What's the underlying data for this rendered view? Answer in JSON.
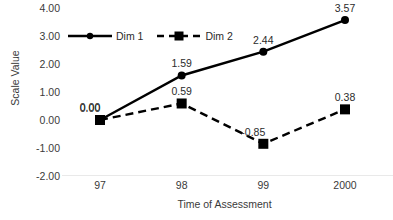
{
  "chart_data": {
    "type": "line",
    "title": "",
    "xlabel": "Time of Assessment",
    "ylabel": "Scale Value",
    "categories": [
      "97",
      "98",
      "99",
      "2000"
    ],
    "ylim": [
      -2.0,
      4.0
    ],
    "yticks": [
      "4.00",
      "3.00",
      "2.00",
      "1.00",
      "0.00",
      "-1.00",
      "-2.00"
    ],
    "ytick_values": [
      4.0,
      3.0,
      2.0,
      1.0,
      0.0,
      -1.0,
      -2.0
    ],
    "grid": false,
    "legend_position": "upper-left-inside",
    "series": [
      {
        "name": "Dim 1",
        "line_style": "solid",
        "marker": "circle",
        "color": "#000000",
        "values": [
          0.0,
          1.59,
          2.44,
          3.57
        ],
        "labels": [
          "0.00",
          "1.59",
          "2.44",
          "3.57"
        ]
      },
      {
        "name": "Dim 2",
        "line_style": "dashed",
        "marker": "square",
        "color": "#000000",
        "values": [
          0.0,
          0.59,
          -0.85,
          0.38
        ],
        "labels": [
          "0.00",
          "0.59",
          "-0.85",
          "0.38"
        ]
      }
    ]
  },
  "colors": {
    "series": "#000000",
    "axis_line": "#e9e9e9",
    "text": "#3a3a3a",
    "background": "#ffffff"
  }
}
